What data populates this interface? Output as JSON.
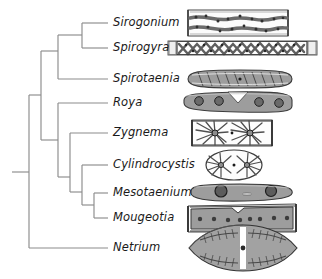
{
  "figure": {
    "type": "cladogram",
    "width": 322,
    "height": 279,
    "line_color": "#8c8c8c",
    "text_color": "#1a1a1a",
    "background": "#ffffff",
    "cell_fill": "#9a9a9a",
    "cell_stroke": "#4a4a4a",
    "taxa": [
      {
        "id": "sirogonium",
        "label": "Sirogonium",
        "tip_y": 23,
        "label_x": 113,
        "img_x": 186,
        "img_w": 106,
        "img_h": 28,
        "shape": "filament-wavy-chloroplast"
      },
      {
        "id": "spirogyra",
        "label": "Spirogyra",
        "tip_y": 48,
        "label_x": 113,
        "img_x": 167,
        "img_w": 150,
        "img_h": 16,
        "shape": "filament-helical-chloroplast"
      },
      {
        "id": "spirotaenia",
        "label": "Spirotaenia",
        "tip_y": 79,
        "label_x": 113,
        "img_x": 186,
        "img_w": 106,
        "img_h": 18,
        "shape": "lozenge-spiral"
      },
      {
        "id": "roya",
        "label": "Roya",
        "tip_y": 103,
        "label_x": 113,
        "img_x": 183,
        "img_w": 110,
        "img_h": 22,
        "shape": "curved-cell-four-pyrenoids"
      },
      {
        "id": "zygnema",
        "label": "Zygnema",
        "tip_y": 133,
        "label_x": 113,
        "img_x": 190,
        "img_w": 84,
        "img_h": 28,
        "shape": "filament-two-stellate"
      },
      {
        "id": "cylindrocystis",
        "label": "Cylindrocystis",
        "tip_y": 165,
        "label_x": 113,
        "img_x": 206,
        "img_w": 56,
        "img_h": 30,
        "shape": "oval-stellate-pair"
      },
      {
        "id": "mesotaenium",
        "label": "Mesotaenium",
        "tip_y": 193,
        "label_x": 113,
        "img_x": 190,
        "img_w": 103,
        "img_h": 22,
        "shape": "rod-cell-two-pyrenoids"
      },
      {
        "id": "mougeotia",
        "label": "Mougeotia",
        "tip_y": 218,
        "label_x": 113,
        "img_x": 187,
        "img_w": 110,
        "img_h": 28,
        "shape": "flat-plate-filament"
      },
      {
        "id": "netrium",
        "label": "Netrium",
        "tip_y": 248,
        "label_x": 113,
        "img_x": 188,
        "img_w": 108,
        "img_h": 44,
        "shape": "fusiform-two-halves"
      }
    ],
    "tree_nodes": [
      {
        "id": "root",
        "x": 12,
        "y": 172,
        "type": "root-stem"
      },
      {
        "id": "n1",
        "x": 29,
        "y": 172,
        "children_y": [
          95,
          248
        ],
        "label": "root-split"
      },
      {
        "id": "n2",
        "x": 41,
        "y": 95,
        "children_y": [
          51,
          140
        ],
        "label": "clade-a"
      },
      {
        "id": "n3",
        "x": 58,
        "y": 51,
        "children_y": [
          35,
          79
        ],
        "label": "clade-spiro"
      },
      {
        "id": "n4",
        "x": 82,
        "y": 35,
        "children_y": [
          23,
          48
        ],
        "label": "sirogonium-spirogyra"
      },
      {
        "id": "n5",
        "x": 58,
        "y": 140,
        "children_y": [
          103,
          177
        ],
        "label": "clade-b"
      },
      {
        "id": "n6",
        "x": 70,
        "y": 177,
        "children_y": [
          133,
          192
        ],
        "label": "clade-c"
      },
      {
        "id": "n7",
        "x": 82,
        "y": 192,
        "children_y": [
          165,
          205
        ],
        "label": "clade-d"
      },
      {
        "id": "n8",
        "x": 94,
        "y": 205,
        "children_y": [
          193,
          218
        ],
        "label": "mesotaenium-mougeotia"
      }
    ],
    "tip_stub_end": 108
  }
}
